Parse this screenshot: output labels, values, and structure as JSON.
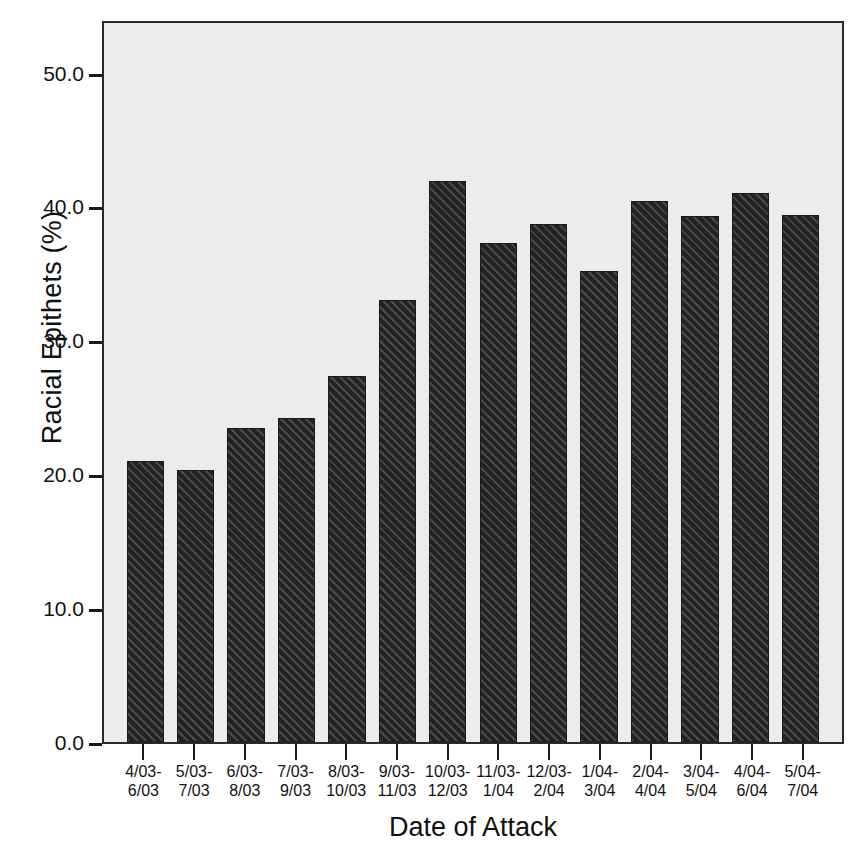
{
  "chart_data": {
    "type": "bar",
    "title": "",
    "xlabel": "Date of Attack",
    "ylabel": "Racial Epithets (%)",
    "categories": [
      "4/03-6/03",
      "5/03-7/03",
      "6/03-8/03",
      "7/03-9/03",
      "8/03-10/03",
      "9/03-11/03",
      "10/03-12/03",
      "11/03-1/04",
      "12/03-2/04",
      "1/04-3/04",
      "2/04-4/04",
      "3/04-5/04",
      "4/04-6/04",
      "5/04-7/04"
    ],
    "category_lines": [
      {
        "line1": "4/03-",
        "line2": "6/03"
      },
      {
        "line1": "5/03-",
        "line2": "7/03"
      },
      {
        "line1": "6/03-",
        "line2": "8/03"
      },
      {
        "line1": "7/03-",
        "line2": "9/03"
      },
      {
        "line1": "8/03-",
        "line2": "10/03"
      },
      {
        "line1": "9/03-",
        "line2": "11/03"
      },
      {
        "line1": "10/03-",
        "line2": "12/03"
      },
      {
        "line1": "11/03-",
        "line2": "1/04"
      },
      {
        "line1": "12/03-",
        "line2": "2/04"
      },
      {
        "line1": "1/04-",
        "line2": "3/04"
      },
      {
        "line1": "2/04-",
        "line2": "4/04"
      },
      {
        "line1": "3/04-",
        "line2": "5/04"
      },
      {
        "line1": "4/04-",
        "line2": "6/04"
      },
      {
        "line1": "5/04-",
        "line2": "7/04"
      }
    ],
    "values": [
      21.1,
      20.4,
      23.6,
      24.3,
      27.5,
      33.2,
      42.1,
      37.5,
      38.9,
      35.4,
      40.6,
      39.5,
      41.2,
      39.6
    ],
    "ylim": [
      0.0,
      54.0
    ],
    "yticks": [
      0.0,
      10.0,
      20.0,
      30.0,
      40.0,
      50.0
    ],
    "ytick_labels": [
      "0.0",
      "10.0",
      "20.0",
      "30.0",
      "40.0",
      "50.0"
    ],
    "grid": false,
    "legend": null,
    "bar_color": "#333333",
    "bar_pattern": "diagonal-hatch",
    "plot_background": "#ececec",
    "figure_background": "#ffffff"
  }
}
